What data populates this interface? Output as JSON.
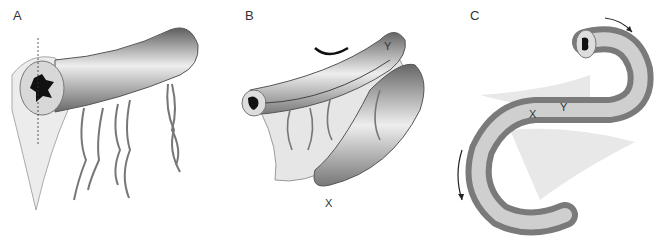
{
  "figure": {
    "panels": [
      {
        "id": "A",
        "label": "A",
        "description": "Bowel segment with mesentery and transverse dashed line; lumen cross-section shown"
      },
      {
        "id": "B",
        "label": "B",
        "description": "Loops folded and sutured side by side; curved suture needle at top",
        "markers": {
          "x": "X",
          "y": "Y"
        }
      },
      {
        "id": "C",
        "label": "C",
        "description": "S-shaped sutured loop with rotation arrows",
        "markers": {
          "x": "X",
          "y": "Y"
        }
      }
    ]
  },
  "colors": {
    "bowel_dark": "#6a6a6a",
    "bowel_light": "#e6e6e6",
    "vessel": "#777777",
    "mesentery": "#e4e4e4",
    "lumen": "#111111"
  }
}
